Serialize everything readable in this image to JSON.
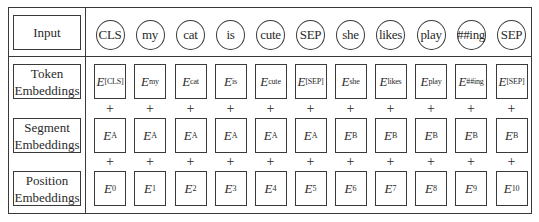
{
  "rows": {
    "input": {
      "label": "Input"
    },
    "token": {
      "label_line1": "Token",
      "label_line2": "Embeddings"
    },
    "segment": {
      "label_line1": "Segment",
      "label_line2": "Embeddings"
    },
    "position": {
      "label_line1": "Position",
      "label_line2": "Embeddings"
    }
  },
  "operator": "+",
  "embedding_symbol": "E",
  "tokens": [
    {
      "input": "CLS",
      "token_sub": "[CLS]",
      "segment_sub": "A",
      "position_sub": "0"
    },
    {
      "input": "my",
      "token_sub": "my",
      "segment_sub": "A",
      "position_sub": "1"
    },
    {
      "input": "cat",
      "token_sub": "cat",
      "segment_sub": "A",
      "position_sub": "2"
    },
    {
      "input": "is",
      "token_sub": "is",
      "segment_sub": "A",
      "position_sub": "3"
    },
    {
      "input": "cute",
      "token_sub": "cute",
      "segment_sub": "A",
      "position_sub": "4"
    },
    {
      "input": "SEP",
      "token_sub": "[SEP]",
      "segment_sub": "A",
      "position_sub": "5"
    },
    {
      "input": "she",
      "token_sub": "she",
      "segment_sub": "B",
      "position_sub": "6"
    },
    {
      "input": "likes",
      "token_sub": "likes",
      "segment_sub": "B",
      "position_sub": "7"
    },
    {
      "input": "play",
      "token_sub": "play",
      "segment_sub": "B",
      "position_sub": "8"
    },
    {
      "input": "##ing",
      "token_sub": "##ing",
      "segment_sub": "B",
      "position_sub": "9"
    },
    {
      "input": "SEP",
      "token_sub": "[SEP]",
      "segment_sub": "B",
      "position_sub": "10"
    }
  ]
}
